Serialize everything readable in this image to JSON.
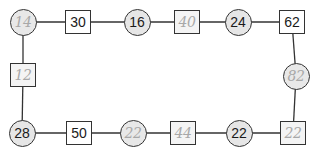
{
  "diagram": {
    "type": "number-loop",
    "line_color": "#333333",
    "circle_fill": "#e6e6e6",
    "square_fill": "#ffffff",
    "printed_text_color": "#1a1a1a",
    "handwritten_text_color": "#a8a8a8",
    "nodes": [
      {
        "id": "n1",
        "shape": "circle",
        "value": "14",
        "handwritten": true,
        "x": 23,
        "y": 22
      },
      {
        "id": "n2",
        "shape": "square",
        "value": "30",
        "handwritten": false,
        "x": 78,
        "y": 22
      },
      {
        "id": "n3",
        "shape": "circle",
        "value": "16",
        "handwritten": false,
        "x": 137,
        "y": 22
      },
      {
        "id": "n4",
        "shape": "square",
        "value": "40",
        "handwritten": true,
        "x": 187,
        "y": 22
      },
      {
        "id": "n5",
        "shape": "circle",
        "value": "24",
        "handwritten": false,
        "x": 238,
        "y": 22
      },
      {
        "id": "n6",
        "shape": "square",
        "value": "62",
        "handwritten": false,
        "x": 292,
        "y": 22
      },
      {
        "id": "n7",
        "shape": "circle",
        "value": "82",
        "handwritten": true,
        "x": 296,
        "y": 76
      },
      {
        "id": "n8",
        "shape": "square",
        "value": "22",
        "handwritten": true,
        "x": 293,
        "y": 133
      },
      {
        "id": "n9",
        "shape": "circle",
        "value": "22",
        "handwritten": false,
        "x": 239,
        "y": 133
      },
      {
        "id": "n10",
        "shape": "square",
        "value": "44",
        "handwritten": true,
        "x": 183,
        "y": 133
      },
      {
        "id": "n11",
        "shape": "circle",
        "value": "22",
        "handwritten": true,
        "x": 133,
        "y": 133
      },
      {
        "id": "n12",
        "shape": "square",
        "value": "50",
        "handwritten": false,
        "x": 79,
        "y": 133
      },
      {
        "id": "n13",
        "shape": "circle",
        "value": "28",
        "handwritten": false,
        "x": 22,
        "y": 133
      },
      {
        "id": "n14",
        "shape": "square",
        "value": "12",
        "handwritten": true,
        "x": 23,
        "y": 75
      }
    ],
    "edges": [
      [
        "n1",
        "n2"
      ],
      [
        "n2",
        "n3"
      ],
      [
        "n3",
        "n4"
      ],
      [
        "n4",
        "n5"
      ],
      [
        "n5",
        "n6"
      ],
      [
        "n6",
        "n7"
      ],
      [
        "n7",
        "n8"
      ],
      [
        "n8",
        "n9"
      ],
      [
        "n9",
        "n10"
      ],
      [
        "n10",
        "n11"
      ],
      [
        "n11",
        "n12"
      ],
      [
        "n12",
        "n13"
      ],
      [
        "n13",
        "n14"
      ],
      [
        "n14",
        "n1"
      ]
    ]
  }
}
